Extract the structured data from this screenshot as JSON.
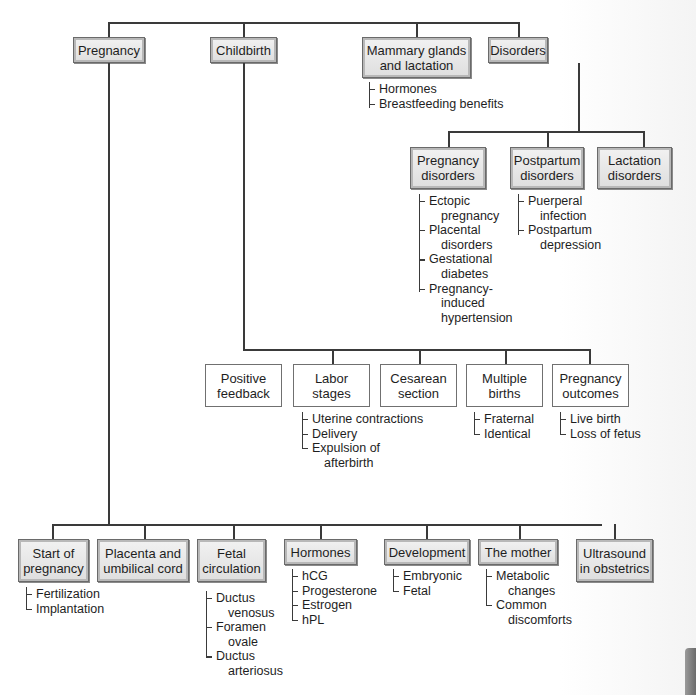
{
  "diagram": {
    "level1": [
      {
        "label": "Pregnancy"
      },
      {
        "label": "Childbirth"
      },
      {
        "label": "Mammary glands and lactation",
        "line1": "Mammary glands",
        "line2": "and lactation",
        "items": [
          "Hormones",
          "Breastfeeding benefits"
        ]
      },
      {
        "label": "Disorders"
      }
    ],
    "disorders": [
      {
        "line1": "Pregnancy",
        "line2": "disorders",
        "items": [
          {
            "line1": "Ectopic",
            "line2": "pregnancy"
          },
          {
            "line1": "Placental",
            "line2": "disorders"
          },
          {
            "line1": "Gestational",
            "line2": "diabetes"
          },
          {
            "line1": "Pregnancy-",
            "line2": "induced",
            "line3": "hypertension"
          }
        ]
      },
      {
        "line1": "Postpartum",
        "line2": "disorders",
        "items": [
          {
            "line1": "Puerperal",
            "line2": "infection"
          },
          {
            "line1": "Postpartum",
            "line2": "depression"
          }
        ]
      },
      {
        "line1": "Lactation",
        "line2": "disorders"
      }
    ],
    "childbirth": [
      {
        "line1": "Positive",
        "line2": "feedback"
      },
      {
        "line1": "Labor",
        "line2": "stages",
        "items": [
          {
            "line1": "Uterine contractions"
          },
          {
            "line1": "Delivery"
          },
          {
            "line1": "Expulsion of",
            "line2": "afterbirth"
          }
        ]
      },
      {
        "line1": "Cesarean",
        "line2": "section"
      },
      {
        "line1": "Multiple",
        "line2": "births",
        "items": [
          {
            "line1": "Fraternal"
          },
          {
            "line1": "Identical"
          }
        ]
      },
      {
        "line1": "Pregnancy",
        "line2": "outcomes",
        "items": [
          {
            "line1": "Live birth"
          },
          {
            "line1": "Loss of fetus"
          }
        ]
      }
    ],
    "pregnancy": [
      {
        "line1": "Start of",
        "line2": "pregnancy",
        "items": [
          {
            "line1": "Fertilization"
          },
          {
            "line1": "Implantation"
          }
        ]
      },
      {
        "line1": "Placenta and",
        "line2": "umbilical cord"
      },
      {
        "line1": "Fetal",
        "line2": "circulation",
        "items": [
          {
            "line1": "Ductus",
            "line2": "venosus"
          },
          {
            "line1": "Foramen",
            "line2": "ovale"
          },
          {
            "line1": "Ductus",
            "line2": "arteriosus"
          }
        ]
      },
      {
        "line1": "Hormones",
        "items": [
          {
            "line1": "hCG"
          },
          {
            "line1": "Progesterone"
          },
          {
            "line1": "Estrogen"
          },
          {
            "line1": "hPL"
          }
        ]
      },
      {
        "line1": "Development",
        "items": [
          {
            "line1": "Embryonic"
          },
          {
            "line1": "Fetal"
          }
        ]
      },
      {
        "line1": "The mother",
        "items": [
          {
            "line1": "Metabolic",
            "line2": "changes"
          },
          {
            "line1": "Common",
            "line2": "discomforts"
          }
        ]
      },
      {
        "line1": "Ultrasound",
        "line2": "in obstetrics"
      }
    ]
  },
  "colors": {
    "line": "#3a3a3a",
    "box_fill_shaded": "#e6e6e6",
    "box_fill_plain": "#ffffff"
  }
}
